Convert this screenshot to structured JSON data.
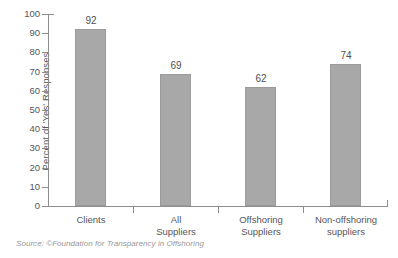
{
  "chart_data": {
    "type": "bar",
    "title": "",
    "xlabel": "",
    "ylabel": "Percent of 'Yes' Responses",
    "ylim": [
      0,
      100
    ],
    "ytick_interval": 10,
    "yticks": [
      100,
      90,
      80,
      70,
      60,
      50,
      40,
      30,
      20,
      10,
      0
    ],
    "grid": false,
    "legend": null,
    "categories": [
      "Clients",
      "All Suppliers",
      "Offshoring Suppliers",
      "Non-offshoring suppliers"
    ],
    "category_lines": [
      [
        "Clients"
      ],
      [
        "All",
        "Suppliers"
      ],
      [
        "Offshoring",
        "Suppliers"
      ],
      [
        "Non-offshoring",
        "suppliers"
      ]
    ],
    "values": [
      92,
      69,
      62,
      74
    ],
    "value_labels": [
      "92",
      "69",
      "62",
      "74"
    ],
    "bar_color": "#a8a8a8",
    "bar_border_color": "#9b9b9b",
    "axis_color": "#8d8d8d",
    "text_color": "#55565a",
    "background_color": "#ffffff"
  },
  "source": {
    "text": "Source: ©Foundation for Transparency in Offshoring"
  }
}
